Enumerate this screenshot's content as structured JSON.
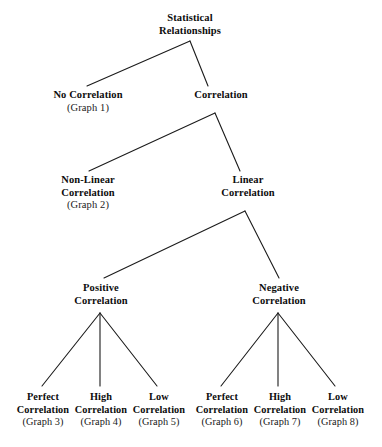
{
  "diagram": {
    "type": "tree",
    "title": "Statistical Relationships",
    "nodes": {
      "root": {
        "line1": "Statistical",
        "line2": "Relationships"
      },
      "no_correlation": {
        "line1": "No Correlation",
        "graph": "(Graph 1)"
      },
      "correlation": {
        "line1": "Correlation"
      },
      "non_linear": {
        "line1": "Non-Linear",
        "line2": "Correlation",
        "graph": "(Graph 2)"
      },
      "linear": {
        "line1": "Linear",
        "line2": "Correlation"
      },
      "positive": {
        "line1": "Positive",
        "line2": "Correlation"
      },
      "negative": {
        "line1": "Negative",
        "line2": "Correlation"
      },
      "pos_perfect": {
        "line1": "Perfect",
        "line2": "Correlation",
        "graph": "(Graph 3)"
      },
      "pos_high": {
        "line1": "High",
        "line2": "Correlation",
        "graph": "(Graph 4)"
      },
      "pos_low": {
        "line1": "Low",
        "line2": "Correlation",
        "graph": "(Graph 5)"
      },
      "neg_perfect": {
        "line1": "Perfect",
        "line2": "Correlation",
        "graph": "(Graph 6)"
      },
      "neg_high": {
        "line1": "High",
        "line2": "Correlation",
        "graph": "(Graph 7)"
      },
      "neg_low": {
        "line1": "Low",
        "line2": "Correlation",
        "graph": "(Graph 8)"
      }
    },
    "colors": {
      "background": "#ffffff",
      "text": "#111111",
      "edge": "#1b1b1b"
    }
  }
}
